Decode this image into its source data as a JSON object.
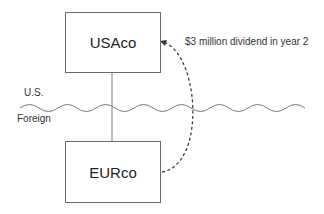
{
  "diagram": {
    "parent": {
      "label": "USAco"
    },
    "subsidiary": {
      "label": "EURco"
    },
    "regions": {
      "upper": "U.S.",
      "lower": "Foreign"
    },
    "flow": {
      "label": "$3 million dividend in year 2",
      "style": "dashed",
      "direction": "EURco to USAco"
    }
  },
  "colors": {
    "line": "#6a6a6a",
    "text": "#222222",
    "background": "#ffffff"
  }
}
